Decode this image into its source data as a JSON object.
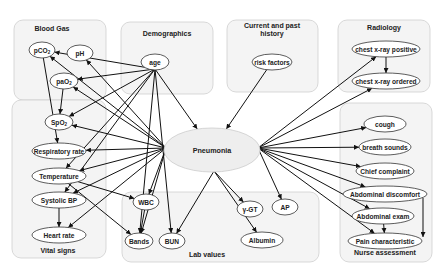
{
  "center": {
    "id": "pneumonia",
    "label": "Pneumonia",
    "x": 212,
    "y": 150,
    "rx": 48,
    "ry": 22
  },
  "groups": [
    {
      "id": "blood-gas",
      "title": "Blood Gas",
      "x": 14,
      "y": 20,
      "w": 92,
      "h": 80,
      "tx": 52,
      "ty": 31
    },
    {
      "id": "demographics",
      "title": "Demographics",
      "x": 121,
      "y": 22,
      "w": 92,
      "h": 72,
      "tx": 167,
      "ty": 36
    },
    {
      "id": "current-past-history",
      "title": "Current and past",
      "title2": "history",
      "x": 227,
      "y": 20,
      "w": 91,
      "h": 72,
      "tx": 272,
      "ty": 28
    },
    {
      "id": "radiology",
      "title": "Radiology",
      "x": 338,
      "y": 20,
      "w": 92,
      "h": 72,
      "tx": 384,
      "ty": 30
    },
    {
      "id": "vital-signs",
      "title": "Vital signs",
      "x": 12,
      "y": 100,
      "w": 94,
      "h": 158,
      "tx": 58,
      "ty": 253
    },
    {
      "id": "lab-values",
      "title": "Lab values",
      "x": 122,
      "y": 192,
      "w": 197,
      "h": 70,
      "tx": 207,
      "ty": 257
    },
    {
      "id": "nurse-assessment",
      "title": "Nurse assessment",
      "x": 340,
      "y": 103,
      "w": 92,
      "h": 159,
      "tx": 385,
      "ty": 255
    }
  ],
  "nodes": [
    {
      "id": "pco2",
      "label": "pCO",
      "sub": "2",
      "x": 42,
      "y": 50,
      "rx": 13,
      "ry": 8
    },
    {
      "id": "ph",
      "label": "pH",
      "x": 80,
      "y": 53,
      "rx": 13,
      "ry": 8
    },
    {
      "id": "pao2",
      "label": "paO",
      "sub": "2",
      "x": 64,
      "y": 81,
      "rx": 14,
      "ry": 8
    },
    {
      "id": "spo2",
      "label": "SpO",
      "sub": "2",
      "x": 59,
      "y": 122,
      "rx": 14,
      "ry": 8
    },
    {
      "id": "age",
      "label": "age",
      "x": 155,
      "y": 62,
      "rx": 14,
      "ry": 8
    },
    {
      "id": "risk-factors",
      "label": "risk factors",
      "x": 272,
      "y": 62,
      "rx": 20,
      "ry": 8
    },
    {
      "id": "cxr-positive",
      "label": "chest x-ray positive",
      "x": 386,
      "y": 49,
      "rx": 34,
      "ry": 8
    },
    {
      "id": "cxr-ordered",
      "label": "chest x-ray ordered",
      "x": 386,
      "y": 81,
      "rx": 34,
      "ry": 8
    },
    {
      "id": "respiratory-rate",
      "label": "Respiratory rate",
      "x": 59,
      "y": 151,
      "rx": 27,
      "ry": 8
    },
    {
      "id": "temperature",
      "label": "Temperature",
      "x": 59,
      "y": 176,
      "rx": 27,
      "ry": 8
    },
    {
      "id": "systolic-bp",
      "label": "Systolic BP",
      "x": 59,
      "y": 200,
      "rx": 27,
      "ry": 8
    },
    {
      "id": "heart-rate",
      "label": "Heart rate",
      "x": 59,
      "y": 235,
      "rx": 27,
      "ry": 8
    },
    {
      "id": "wbc",
      "label": "WBC",
      "x": 146,
      "y": 202,
      "rx": 13,
      "ry": 8
    },
    {
      "id": "bands",
      "label": "Bands",
      "x": 139,
      "y": 241,
      "rx": 14,
      "ry": 8
    },
    {
      "id": "bun",
      "label": "BUN",
      "x": 172,
      "y": 241,
      "rx": 13,
      "ry": 8
    },
    {
      "id": "ggt",
      "label": "γ-GT",
      "x": 250,
      "y": 209,
      "rx": 13,
      "ry": 8
    },
    {
      "id": "ap",
      "label": "AP",
      "x": 285,
      "y": 207,
      "rx": 13,
      "ry": 8
    },
    {
      "id": "albumin",
      "label": "Albumin",
      "x": 262,
      "y": 240,
      "rx": 21,
      "ry": 8
    },
    {
      "id": "cough",
      "label": "cough",
      "x": 385,
      "y": 124,
      "rx": 21,
      "ry": 8
    },
    {
      "id": "breath-sounds",
      "label": "breath sounds",
      "x": 385,
      "y": 147,
      "rx": 26,
      "ry": 8
    },
    {
      "id": "chief-complaint",
      "label": "Chief complaint",
      "x": 385,
      "y": 171,
      "rx": 29,
      "ry": 8
    },
    {
      "id": "abdominal-discomfort",
      "label": "Abdominal discomfort",
      "x": 385,
      "y": 194,
      "rx": 42,
      "ry": 8
    },
    {
      "id": "abdominal-exam",
      "label": "Abdominal exam",
      "x": 383,
      "y": 216,
      "rx": 31,
      "ry": 8
    },
    {
      "id": "pain-characteristic",
      "label": "Pain characteristic",
      "x": 385,
      "y": 241,
      "rx": 37,
      "ry": 8
    }
  ],
  "edges": [
    {
      "from": "age",
      "to": "pco2"
    },
    {
      "from": "age",
      "to": "pao2"
    },
    {
      "from": "age",
      "to": "spo2"
    },
    {
      "from": "age",
      "to": "temperature"
    },
    {
      "from": "age",
      "to": "systolic-bp"
    },
    {
      "from": "age",
      "to": "bands"
    },
    {
      "from": "age",
      "to": "bun"
    },
    {
      "from": "age",
      "to": "pneumonia"
    },
    {
      "from": "risk-factors",
      "to": "pneumonia"
    },
    {
      "from": "pneumonia",
      "to": "pco2"
    },
    {
      "from": "pneumonia",
      "to": "ph"
    },
    {
      "from": "pneumonia",
      "to": "pao2"
    },
    {
      "from": "pneumonia",
      "to": "spo2"
    },
    {
      "from": "pneumonia",
      "to": "respiratory-rate"
    },
    {
      "from": "pneumonia",
      "to": "temperature"
    },
    {
      "from": "pneumonia",
      "to": "systolic-bp"
    },
    {
      "from": "pneumonia",
      "to": "heart-rate"
    },
    {
      "from": "pneumonia",
      "to": "wbc"
    },
    {
      "from": "pneumonia",
      "to": "bands"
    },
    {
      "from": "pneumonia",
      "to": "bun"
    },
    {
      "from": "pneumonia",
      "to": "ggt"
    },
    {
      "from": "pneumonia",
      "to": "ap"
    },
    {
      "from": "pneumonia",
      "to": "albumin"
    },
    {
      "from": "pneumonia",
      "to": "cxr-positive"
    },
    {
      "from": "pneumonia",
      "to": "cxr-ordered"
    },
    {
      "from": "pneumonia",
      "to": "cough"
    },
    {
      "from": "pneumonia",
      "to": "breath-sounds"
    },
    {
      "from": "pneumonia",
      "to": "chief-complaint"
    },
    {
      "from": "pneumonia",
      "to": "abdominal-discomfort"
    },
    {
      "from": "pneumonia",
      "to": "abdominal-exam"
    },
    {
      "from": "pneumonia",
      "to": "pain-characteristic"
    },
    {
      "from": "pco2",
      "to": "respiratory-rate"
    },
    {
      "from": "pao2",
      "to": "spo2"
    },
    {
      "from": "temperature",
      "to": "wbc"
    },
    {
      "from": "temperature",
      "to": "bands"
    },
    {
      "from": "systolic-bp",
      "to": "heart-rate"
    },
    {
      "from": "wbc",
      "to": "bands"
    },
    {
      "from": "cxr-positive",
      "to": "cxr-ordered"
    },
    {
      "from": "abdominal-exam",
      "to": "pain-characteristic"
    },
    {
      "from": "abdominal-discomfort",
      "to": "pain-characteristic",
      "route": "side"
    }
  ],
  "colors": {
    "group_fill": "#f4f4f4",
    "group_stroke": "#cfcfcf",
    "node_fill": "#ffffff",
    "node_stroke": "#333333",
    "center_fill": "#eeeeee",
    "edge": "#111111"
  }
}
